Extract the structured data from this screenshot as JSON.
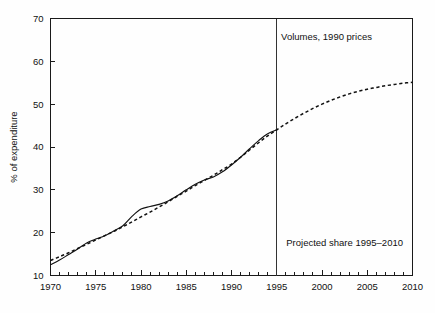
{
  "chart_data": {
    "type": "line",
    "title": "",
    "xlabel": "",
    "ylabel": "% of expenditure",
    "xlim": [
      1970,
      2010
    ],
    "ylim": [
      10,
      70
    ],
    "grid": false,
    "legend_position": "none",
    "x_ticks_major": [
      1970,
      1975,
      1980,
      1985,
      1990,
      1995,
      2000,
      2005,
      2010
    ],
    "x_tick_labels": [
      "1970",
      "1975",
      "1980",
      "1985",
      "1990",
      "1995",
      "2000",
      "2005",
      "2010"
    ],
    "x_minor_tick_interval": 1,
    "y_ticks": [
      10,
      20,
      30,
      40,
      50,
      60,
      70
    ],
    "y_tick_labels": [
      "10",
      "20",
      "30",
      "40",
      "50",
      "60",
      "70"
    ],
    "annotations": [
      {
        "text": "Volumes, 1990 prices",
        "x": 2000.5,
        "y": 65.0
      },
      {
        "text": "Projected share 1995–2010",
        "x": 2002.5,
        "y": 17.0
      }
    ],
    "reference_lines": [
      {
        "orientation": "vertical",
        "x": 1995,
        "label": "1995 projection start"
      }
    ],
    "series": [
      {
        "name": "Actual share",
        "style": "solid",
        "x": [
          1970,
          1971,
          1972,
          1973,
          1974,
          1975,
          1976,
          1977,
          1978,
          1979,
          1980,
          1981,
          1982,
          1983,
          1984,
          1985,
          1986,
          1987,
          1988,
          1989,
          1990,
          1991,
          1992,
          1993,
          1994,
          1995
        ],
        "values": [
          12.5,
          13.6,
          14.9,
          16.2,
          17.6,
          18.5,
          19.3,
          20.4,
          21.6,
          23.8,
          25.5,
          26.1,
          26.6,
          27.4,
          28.6,
          30.0,
          31.3,
          32.3,
          33.0,
          34.2,
          35.8,
          37.6,
          39.6,
          41.5,
          43.1,
          44.0
        ]
      },
      {
        "name": "Fitted trend and projection",
        "style": "dashed",
        "x": [
          1970,
          1971,
          1972,
          1973,
          1974,
          1975,
          1976,
          1977,
          1978,
          1979,
          1980,
          1981,
          1982,
          1983,
          1984,
          1985,
          1986,
          1987,
          1988,
          1989,
          1990,
          1991,
          1992,
          1993,
          1994,
          1995,
          1996,
          1997,
          1998,
          1999,
          2000,
          2001,
          2002,
          2003,
          2004,
          2005,
          2006,
          2007,
          2008,
          2009,
          2010
        ],
        "values": [
          13.5,
          14.4,
          15.3,
          16.3,
          17.3,
          18.3,
          19.3,
          20.3,
          21.4,
          22.5,
          23.7,
          24.8,
          26.0,
          27.2,
          28.5,
          29.7,
          31.0,
          32.2,
          33.4,
          34.7,
          36.0,
          37.6,
          39.3,
          41.0,
          42.6,
          44.0,
          45.4,
          46.7,
          47.9,
          49.0,
          50.0,
          50.9,
          51.7,
          52.4,
          53.0,
          53.5,
          53.9,
          54.3,
          54.6,
          54.9,
          55.1
        ]
      }
    ]
  }
}
